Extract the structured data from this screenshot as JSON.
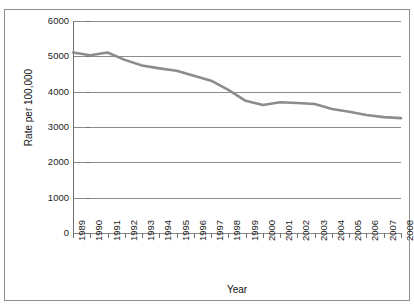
{
  "figure": {
    "clipped_caption": "",
    "xlabel": "Year",
    "ylabel": "Rate per 100,000"
  },
  "style": {
    "line_color": "#8c8c8c",
    "grid_color": "#8b8b8b",
    "axis_color": "#6e6e6e",
    "text_color": "#1b1b1b",
    "background": "#ffffff"
  },
  "chart_data": {
    "type": "line",
    "title": "",
    "xlabel": "Year",
    "ylabel": "Rate per 100,000",
    "categories": [
      "1989",
      "1990",
      "1991",
      "1992",
      "1993",
      "1994",
      "1995",
      "1996",
      "1997",
      "1998",
      "1999",
      "2000",
      "2001",
      "2002",
      "2003",
      "2004",
      "2005",
      "2006",
      "2007",
      "2008"
    ],
    "values": [
      5110,
      5030,
      5110,
      4900,
      4740,
      4660,
      4590,
      4450,
      4310,
      4050,
      3740,
      3620,
      3700,
      3680,
      3650,
      3510,
      3430,
      3340,
      3280,
      3250
    ],
    "ylim": [
      0,
      6000
    ],
    "yticks": [
      0,
      1000,
      2000,
      3000,
      4000,
      5000,
      6000
    ],
    "ytick_labels": [
      "0",
      "1000",
      "2000",
      "3000",
      "4000",
      "5000",
      "6000"
    ],
    "grid": "horizontal",
    "legend": "none",
    "series": [
      {
        "name": "Rate per 100,000",
        "values": [
          5110,
          5030,
          5110,
          4900,
          4740,
          4660,
          4590,
          4450,
          4310,
          4050,
          3740,
          3620,
          3700,
          3680,
          3650,
          3510,
          3430,
          3340,
          3280,
          3250
        ]
      }
    ]
  }
}
